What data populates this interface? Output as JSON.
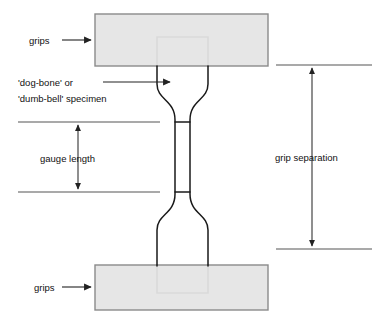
{
  "figure": {
    "background_color": "#ffffff",
    "width": 376,
    "height": 316
  },
  "labels": {
    "grips_top": "grips",
    "grips_bottom": "grips",
    "specimen_line1": "'dog-bone' or",
    "specimen_line2": "'dumb-bell' specimen",
    "gauge_length": "gauge length",
    "grip_separation": "grip separation"
  },
  "colors": {
    "grip_fill": "#e2e2e2",
    "grip_stroke": "#8a8a8a",
    "specimen_stroke": "#1a1a1a",
    "specimen_hidden_stroke": "#9a9a9a",
    "dimension_line": "#555555",
    "text": "#111111"
  },
  "parts": {
    "grip_top": {
      "name": "top grip block",
      "x": 95,
      "y": 14,
      "width": 173,
      "height": 52
    },
    "grip_bottom": {
      "name": "bottom grip block",
      "x": 95,
      "y": 265,
      "width": 173,
      "height": 45
    },
    "specimen": {
      "name": "dog-bone tensile specimen",
      "shoulder_left_x": 157,
      "shoulder_right_x": 208,
      "gauge_left_x": 175,
      "gauge_right_x": 190,
      "gauge_top_y": 122,
      "gauge_bottom_y": 192
    }
  },
  "dimensions": {
    "gauge_length": {
      "label": "gauge length",
      "top_y": 122,
      "bottom_y": 192,
      "arrow_x": 78,
      "extension_from_x": 18,
      "extension_to_x": 160
    },
    "grip_separation": {
      "label": "grip separation",
      "top_y": 65,
      "bottom_y": 249,
      "arrow_x": 312,
      "extension_from_x": 276,
      "extension_to_x": 372
    }
  },
  "leaders": {
    "grips_top": {
      "from_x": 62,
      "to_x": 93,
      "y": 40
    },
    "grips_bottom": {
      "from_x": 62,
      "to_x": 93,
      "y": 287
    },
    "specimen": {
      "from_x": 103,
      "to_x": 172,
      "y": 82
    }
  }
}
